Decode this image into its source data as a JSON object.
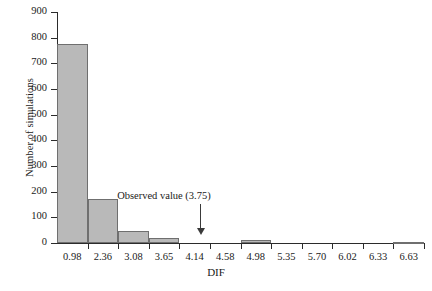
{
  "chart_data": {
    "type": "bar",
    "title": "",
    "xlabel": "DIF",
    "ylabel": "Number of simulations",
    "categories": [
      "0.98",
      "2.36",
      "3.08",
      "3.65",
      "4.14",
      "4.58",
      "4.98",
      "5.35",
      "5.70",
      "6.02",
      "6.33",
      "6.63"
    ],
    "values": [
      777,
      170,
      45,
      20,
      0,
      0,
      10,
      0,
      0,
      0,
      0,
      5
    ],
    "ylim": [
      0,
      900
    ],
    "yticks": [
      0,
      100,
      200,
      300,
      400,
      500,
      600,
      700,
      800,
      900
    ],
    "ytick_labels": [
      "0",
      "100",
      "200",
      "300",
      "400",
      "500",
      "600",
      "700",
      "800",
      "900"
    ],
    "grid": false,
    "legend": "none",
    "bar_fill_color": "#b9b9b9",
    "bar_edge_color": "#6f6f6f",
    "axis_color": "#2b2b2b",
    "annotations": [
      {
        "label": "Observed value (3.75)",
        "value": 3.75,
        "arrow": "down-arrow-icon"
      }
    ]
  }
}
